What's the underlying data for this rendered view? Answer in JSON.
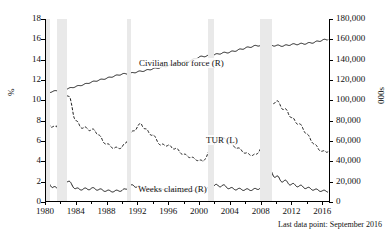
{
  "title_fragment": "",
  "footnote": "Last data point: September 2016",
  "axes": {
    "left": {
      "title": "%",
      "min": 0,
      "max": 18,
      "step": 2,
      "ticks": [
        "0",
        "2",
        "4",
        "6",
        "8",
        "10",
        "12",
        "14",
        "16",
        "18"
      ]
    },
    "right": {
      "title": "000s",
      "min": 0,
      "max": 180000,
      "step": 20000,
      "ticks": [
        "0",
        "20,000",
        "40,000",
        "60,000",
        "80,000",
        "100,000",
        "120,000",
        "140,000",
        "160,000",
        "180,000"
      ]
    },
    "bottom": {
      "min": 1980,
      "max": 2017,
      "ticks": [
        "1980",
        "1984",
        "1988",
        "1992",
        "1996",
        "2000",
        "2004",
        "2008",
        "2012",
        "2016"
      ]
    }
  },
  "labels": {
    "civilian_labor_force": "Civilian labor force (R)",
    "tur": "TUR (L)",
    "weeks_claimed": "Weeks claimed (R)"
  },
  "colors": {
    "line": "#1a1a1a",
    "recession_band": "#e9e9e9",
    "background": "#ffffff"
  },
  "chart_data": {
    "type": "line",
    "title": "",
    "xlabel": "",
    "ylabel": "%",
    "y2label": "000s",
    "xlim": [
      1980,
      2017
    ],
    "ylim": [
      0,
      18
    ],
    "y2lim": [
      0,
      180000
    ],
    "grid": false,
    "legend": "inline-annotations",
    "recession_bands": [
      {
        "start": 1980.0,
        "end": 1980.6
      },
      {
        "start": 1981.5,
        "end": 1982.9
      },
      {
        "start": 1990.6,
        "end": 1991.2
      },
      {
        "start": 2001.2,
        "end": 2001.9
      },
      {
        "start": 2007.9,
        "end": 2009.5
      }
    ],
    "series": [
      {
        "name": "TUR (L)",
        "axis": "left",
        "units": "percent",
        "style": "dashed",
        "x": [
          1980.0,
          1980.25,
          1980.5,
          1980.75,
          1981.0,
          1981.25,
          1981.5,
          1981.75,
          1982.0,
          1982.25,
          1982.5,
          1982.75,
          1983.0,
          1983.25,
          1983.5,
          1983.75,
          1984.0,
          1984.5,
          1985.0,
          1985.5,
          1986.0,
          1986.5,
          1987.0,
          1987.5,
          1988.0,
          1988.5,
          1989.0,
          1989.5,
          1990.0,
          1990.5,
          1991.0,
          1991.5,
          1992.0,
          1992.5,
          1993.0,
          1993.5,
          1994.0,
          1994.5,
          1995.0,
          1995.5,
          1996.0,
          1996.5,
          1997.0,
          1997.5,
          1998.0,
          1998.5,
          1999.0,
          1999.5,
          2000.0,
          2000.5,
          2001.0,
          2001.5,
          2002.0,
          2002.5,
          2003.0,
          2003.5,
          2004.0,
          2004.5,
          2005.0,
          2005.5,
          2006.0,
          2006.5,
          2007.0,
          2007.5,
          2008.0,
          2008.5,
          2009.0,
          2009.25,
          2009.5,
          2009.75,
          2010.0,
          2010.5,
          2011.0,
          2011.5,
          2012.0,
          2012.5,
          2013.0,
          2013.5,
          2014.0,
          2014.5,
          2015.0,
          2015.5,
          2016.0,
          2016.5,
          2016.75
        ],
        "y": [
          6.4,
          7.3,
          7.7,
          7.5,
          7.4,
          7.3,
          7.4,
          8.0,
          8.9,
          9.6,
          10.2,
          10.8,
          10.4,
          10.1,
          9.4,
          8.5,
          8.0,
          7.5,
          7.3,
          7.2,
          7.1,
          7.0,
          6.6,
          6.0,
          5.7,
          5.5,
          5.3,
          5.3,
          5.4,
          5.8,
          6.6,
          7.0,
          7.4,
          7.7,
          7.2,
          6.8,
          6.6,
          6.1,
          5.6,
          5.6,
          5.6,
          5.3,
          5.3,
          4.9,
          4.7,
          4.5,
          4.4,
          4.2,
          4.1,
          4.0,
          4.5,
          5.3,
          5.8,
          6.0,
          6.3,
          6.1,
          5.8,
          5.5,
          5.3,
          5.1,
          4.8,
          4.7,
          4.6,
          4.7,
          5.3,
          6.5,
          8.5,
          9.3,
          9.6,
          9.9,
          9.9,
          9.6,
          9.1,
          8.9,
          8.3,
          7.9,
          7.7,
          7.2,
          6.7,
          6.1,
          5.7,
          5.2,
          5.0,
          4.9,
          5.0
        ]
      },
      {
        "name": "Civilian labor force (R)",
        "axis": "right",
        "units": "thousands",
        "style": "solid",
        "x": [
          1980,
          1981,
          1982,
          1983,
          1984,
          1985,
          1986,
          1987,
          1988,
          1989,
          1990,
          1991,
          1992,
          1993,
          1994,
          1995,
          1996,
          1997,
          1998,
          1999,
          2000,
          2001,
          2002,
          2003,
          2004,
          2005,
          2006,
          2007,
          2008,
          2009,
          2010,
          2011,
          2012,
          2013,
          2014,
          2015,
          2016,
          2016.75
        ],
        "y": [
          106900,
          108700,
          110200,
          111550,
          113540,
          115460,
          117830,
          119860,
          121670,
          123870,
          125840,
          126350,
          128100,
          129200,
          131060,
          132300,
          133940,
          136300,
          137670,
          139370,
          142580,
          143730,
          144860,
          146500,
          147400,
          149320,
          151430,
          153120,
          154290,
          154140,
          153890,
          153620,
          154970,
          155390,
          155920,
          157130,
          159190,
          159900
        ]
      },
      {
        "name": "Weeks claimed (R)",
        "axis": "right",
        "units": "thousands",
        "style": "solid",
        "x": [
          1980.0,
          1980.25,
          1980.5,
          1980.75,
          1981.0,
          1981.5,
          1982.0,
          1982.5,
          1982.75,
          1983.0,
          1983.5,
          1984.0,
          1984.5,
          1985.0,
          1985.5,
          1986.0,
          1986.5,
          1987.0,
          1987.5,
          1988.0,
          1988.5,
          1989.0,
          1989.5,
          1990.0,
          1990.5,
          1991.0,
          1991.5,
          1992.0,
          1992.5,
          1993.0,
          1993.5,
          1994.0,
          1994.5,
          1995.0,
          1995.5,
          1996.0,
          1996.5,
          1997.0,
          1997.5,
          1998.0,
          1998.5,
          1999.0,
          1999.5,
          2000.0,
          2000.5,
          2001.0,
          2001.5,
          2002.0,
          2002.5,
          2003.0,
          2003.5,
          2004.0,
          2004.5,
          2005.0,
          2005.5,
          2006.0,
          2006.5,
          2007.0,
          2007.5,
          2008.0,
          2008.5,
          2009.0,
          2009.25,
          2009.5,
          2010.0,
          2010.5,
          2011.0,
          2011.5,
          2012.0,
          2012.5,
          2013.0,
          2013.5,
          2014.0,
          2014.5,
          2015.0,
          2015.5,
          2016.0,
          2016.5,
          2016.75
        ],
        "y": [
          14500,
          17800,
          19500,
          16800,
          14200,
          14000,
          17600,
          20500,
          21800,
          20200,
          16800,
          13200,
          12400,
          13000,
          12600,
          13400,
          12900,
          12300,
          11600,
          11000,
          10800,
          10500,
          11200,
          11400,
          12600,
          15400,
          16200,
          15200,
          14300,
          13300,
          12600,
          11800,
          11400,
          11500,
          11600,
          12000,
          11500,
          11100,
          10700,
          10400,
          10500,
          10500,
          10600,
          10300,
          11200,
          13000,
          15600,
          16400,
          15900,
          16200,
          15100,
          13500,
          12900,
          12700,
          12400,
          12200,
          12000,
          12300,
          12600,
          14200,
          18600,
          26500,
          29500,
          28200,
          25000,
          22000,
          20600,
          19200,
          17400,
          16500,
          15800,
          14900,
          13800,
          13000,
          12200,
          11500,
          11000,
          10600,
          10400
        ]
      }
    ]
  }
}
